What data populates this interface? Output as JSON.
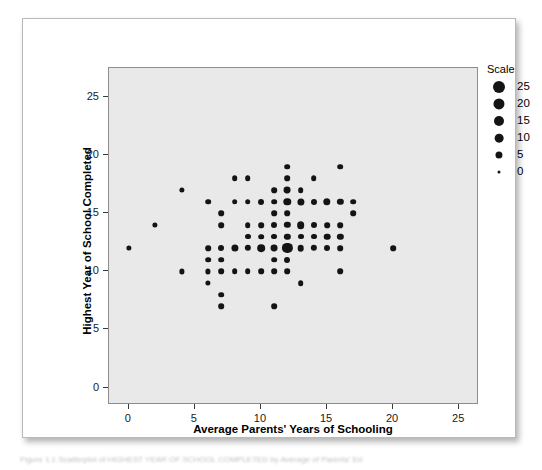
{
  "figure": {
    "caption_clipped": "Figure 1.1  Scatterplot of HIGHEST YEAR OF SCHOOL COMPLETED by Average of Parents' Ed"
  },
  "legend": {
    "title": "Scale",
    "entries": [
      {
        "label": "25",
        "size": 25
      },
      {
        "label": "20",
        "size": 20
      },
      {
        "label": "15",
        "size": 15
      },
      {
        "label": "10",
        "size": 10
      },
      {
        "label": "5",
        "size": 5
      },
      {
        "label": "0",
        "size": 0
      }
    ]
  },
  "chart_data": {
    "type": "scatter",
    "title": "",
    "xlabel": "Average Parents' Years of Schooling",
    "ylabel": "Highest Year of School Completed",
    "xlim": [
      -1.5,
      26.5
    ],
    "ylim": [
      -1.5,
      27.5
    ],
    "xticks": [
      0,
      5,
      10,
      15,
      20,
      25
    ],
    "yticks": [
      0,
      5,
      10,
      15,
      20,
      25
    ],
    "xtick_labels": [
      "0",
      "5",
      "10",
      "15",
      "20",
      "25"
    ],
    "ytick_labels": [
      "0",
      "5",
      "10",
      "15",
      "20",
      "25"
    ],
    "grid": false,
    "legend_position": "right-outside",
    "size_encoding": "marker area encodes count (Scale 0-25)",
    "points": [
      {
        "x": 0,
        "y": 12,
        "size": 3
      },
      {
        "x": 2,
        "y": 14,
        "size": 3
      },
      {
        "x": 4,
        "y": 17,
        "size": 3
      },
      {
        "x": 4,
        "y": 10,
        "size": 3
      },
      {
        "x": 6,
        "y": 16,
        "size": 4
      },
      {
        "x": 6,
        "y": 12,
        "size": 4
      },
      {
        "x": 6,
        "y": 11,
        "size": 4
      },
      {
        "x": 6,
        "y": 10,
        "size": 3
      },
      {
        "x": 6,
        "y": 9,
        "size": 3
      },
      {
        "x": 7,
        "y": 15,
        "size": 4
      },
      {
        "x": 7,
        "y": 14,
        "size": 4
      },
      {
        "x": 7,
        "y": 12,
        "size": 5
      },
      {
        "x": 7,
        "y": 11,
        "size": 4
      },
      {
        "x": 7,
        "y": 10,
        "size": 4
      },
      {
        "x": 7,
        "y": 8,
        "size": 4
      },
      {
        "x": 7,
        "y": 7,
        "size": 4
      },
      {
        "x": 8,
        "y": 18,
        "size": 4
      },
      {
        "x": 8,
        "y": 16,
        "size": 4
      },
      {
        "x": 8,
        "y": 12,
        "size": 9
      },
      {
        "x": 8,
        "y": 10,
        "size": 4
      },
      {
        "x": 9,
        "y": 18,
        "size": 4
      },
      {
        "x": 9,
        "y": 16,
        "size": 4
      },
      {
        "x": 9,
        "y": 14,
        "size": 4
      },
      {
        "x": 9,
        "y": 13,
        "size": 5
      },
      {
        "x": 9,
        "y": 12,
        "size": 6
      },
      {
        "x": 9,
        "y": 10,
        "size": 4
      },
      {
        "x": 10,
        "y": 16,
        "size": 5
      },
      {
        "x": 10,
        "y": 14,
        "size": 4
      },
      {
        "x": 10,
        "y": 13,
        "size": 4
      },
      {
        "x": 10,
        "y": 12,
        "size": 11
      },
      {
        "x": 10,
        "y": 10,
        "size": 4
      },
      {
        "x": 11,
        "y": 17,
        "size": 4
      },
      {
        "x": 11,
        "y": 16,
        "size": 4
      },
      {
        "x": 11,
        "y": 15,
        "size": 4
      },
      {
        "x": 11,
        "y": 14,
        "size": 5
      },
      {
        "x": 11,
        "y": 13,
        "size": 5
      },
      {
        "x": 11,
        "y": 12,
        "size": 8
      },
      {
        "x": 11,
        "y": 11,
        "size": 4
      },
      {
        "x": 11,
        "y": 10,
        "size": 4
      },
      {
        "x": 11,
        "y": 7,
        "size": 4
      },
      {
        "x": 12,
        "y": 19,
        "size": 4
      },
      {
        "x": 12,
        "y": 18,
        "size": 4
      },
      {
        "x": 12,
        "y": 17,
        "size": 8
      },
      {
        "x": 12,
        "y": 16,
        "size": 10
      },
      {
        "x": 12,
        "y": 15,
        "size": 4
      },
      {
        "x": 12,
        "y": 14,
        "size": 6
      },
      {
        "x": 12,
        "y": 13,
        "size": 6
      },
      {
        "x": 12,
        "y": 12,
        "size": 25
      },
      {
        "x": 12,
        "y": 11,
        "size": 5
      },
      {
        "x": 12,
        "y": 10,
        "size": 4
      },
      {
        "x": 13,
        "y": 17,
        "size": 4
      },
      {
        "x": 13,
        "y": 16,
        "size": 9
      },
      {
        "x": 13,
        "y": 14,
        "size": 11
      },
      {
        "x": 13,
        "y": 13,
        "size": 5
      },
      {
        "x": 13,
        "y": 12,
        "size": 7
      },
      {
        "x": 13,
        "y": 9,
        "size": 4
      },
      {
        "x": 14,
        "y": 18,
        "size": 4
      },
      {
        "x": 14,
        "y": 16,
        "size": 5
      },
      {
        "x": 14,
        "y": 14,
        "size": 5
      },
      {
        "x": 14,
        "y": 13,
        "size": 5
      },
      {
        "x": 14,
        "y": 12,
        "size": 6
      },
      {
        "x": 15,
        "y": 16,
        "size": 10
      },
      {
        "x": 15,
        "y": 14,
        "size": 4
      },
      {
        "x": 15,
        "y": 13,
        "size": 7
      },
      {
        "x": 15,
        "y": 12,
        "size": 5
      },
      {
        "x": 16,
        "y": 19,
        "size": 4
      },
      {
        "x": 16,
        "y": 16,
        "size": 6
      },
      {
        "x": 16,
        "y": 14,
        "size": 4
      },
      {
        "x": 16,
        "y": 13,
        "size": 6
      },
      {
        "x": 16,
        "y": 12,
        "size": 4
      },
      {
        "x": 16,
        "y": 10,
        "size": 4
      },
      {
        "x": 17,
        "y": 16,
        "size": 4
      },
      {
        "x": 17,
        "y": 15,
        "size": 4
      },
      {
        "x": 20,
        "y": 12,
        "size": 4
      }
    ]
  }
}
